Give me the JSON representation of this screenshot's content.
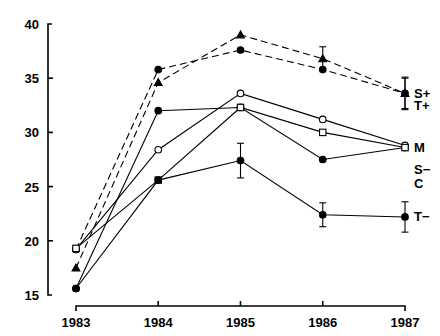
{
  "chart_data": {
    "type": "line",
    "title": "",
    "xlabel": "",
    "ylabel": "",
    "categories": [
      "1983",
      "1984",
      "1985",
      "1986",
      "1987"
    ],
    "x": [
      1983,
      1984,
      1985,
      1986,
      1987
    ],
    "xlim": [
      1983,
      1987
    ],
    "ylim": [
      15,
      40
    ],
    "yticks": [
      15,
      20,
      25,
      30,
      35,
      40
    ],
    "xticks": [
      "1983",
      "1984",
      "1985",
      "1986",
      "1987"
    ],
    "grid": false,
    "legend_position": "right-inline",
    "series": [
      {
        "name": "S+",
        "label": "S+",
        "marker": "triangle",
        "fill": "solid",
        "linestyle": "dashed",
        "values": [
          17.5,
          34.6,
          39.0,
          36.8,
          33.6
        ],
        "errors": [
          null,
          null,
          null,
          1.1,
          1.4
        ]
      },
      {
        "name": "T+",
        "label": "T+",
        "marker": "circle",
        "fill": "solid",
        "linestyle": "dashed",
        "values": [
          19.2,
          35.8,
          37.6,
          35.8,
          33.6
        ],
        "errors": [
          null,
          null,
          null,
          null,
          1.5
        ]
      },
      {
        "name": "M",
        "label": "M",
        "marker": "circle",
        "fill": "solid",
        "linestyle": "solid",
        "values": [
          15.6,
          32.0,
          32.3,
          27.5,
          28.6
        ],
        "errors": [
          null,
          null,
          null,
          null,
          null
        ]
      },
      {
        "name": "S-",
        "label": "S−",
        "marker": "circle",
        "fill": "open",
        "linestyle": "solid",
        "values": [
          19.2,
          28.4,
          33.6,
          31.2,
          28.8
        ],
        "errors": [
          null,
          null,
          null,
          null,
          null
        ]
      },
      {
        "name": "C",
        "label": "C",
        "marker": "square",
        "fill": "open",
        "linestyle": "solid",
        "values": [
          19.3,
          25.6,
          32.3,
          30.0,
          28.6
        ],
        "errors": [
          null,
          null,
          null,
          null,
          null
        ]
      },
      {
        "name": "T-",
        "label": "T−",
        "marker": "circle",
        "fill": "solid",
        "linestyle": "solid",
        "values": [
          15.6,
          25.6,
          27.4,
          22.4,
          22.2
        ],
        "errors": [
          null,
          null,
          1.6,
          1.1,
          1.4
        ]
      }
    ],
    "series_labels": [
      "S+",
      "T+",
      "M",
      "S−",
      "C",
      "T−"
    ],
    "colors": {
      "line": "#000000",
      "background": "#ffffff",
      "text": "#000000"
    }
  }
}
